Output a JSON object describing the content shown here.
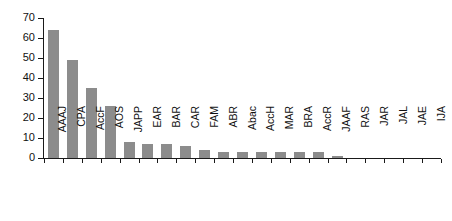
{
  "chart_data": {
    "type": "bar",
    "title": "",
    "subtitle": "",
    "xlabel": "",
    "ylabel": "",
    "ylim": [
      0,
      70
    ],
    "yticks": [
      0,
      10,
      20,
      30,
      40,
      50,
      60,
      70
    ],
    "grid": false,
    "legend": null,
    "bar_color": "#8c8c8c",
    "axis_color": "#1a1a1a",
    "background_color": "#ffffff",
    "categories": [
      "AAAJ",
      "CPA",
      "AccF",
      "AOS",
      "JAPP",
      "EAR",
      "BAR",
      "CAR",
      "FAM",
      "ABR",
      "Abac",
      "AccH",
      "MAR",
      "BRA",
      "AccR",
      "JAAF",
      "RAS",
      "JAR",
      "JAL",
      "JAE",
      "IJA"
    ],
    "values": [
      64,
      49,
      35,
      26,
      8,
      7,
      7,
      6,
      4,
      3,
      3,
      3,
      3,
      3,
      3,
      1,
      0,
      0,
      0,
      0,
      0
    ]
  }
}
